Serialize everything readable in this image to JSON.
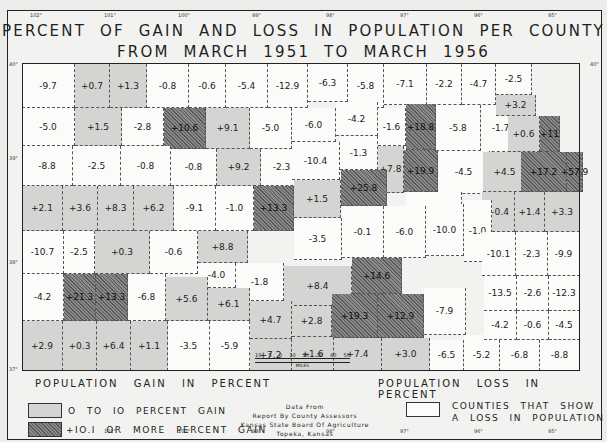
{
  "title": {
    "line1": "PERCENT OF GAIN AND LOSS IN POPULATION PER COUNTY",
    "line2": "FROM MARCH 1951 TO MARCH 1956"
  },
  "longitudes_top": [
    "102°",
    "101°",
    "100°",
    "99°",
    "98°",
    "97°",
    "96°",
    "95°"
  ],
  "longitudes_bottom": [
    "102°",
    "101°",
    "100°",
    "99°",
    "98°",
    "97°",
    "96°",
    "95°"
  ],
  "latitudes": [
    "40°",
    "39°",
    "38°",
    "37°"
  ],
  "legend": {
    "gain_heading": "POPULATION GAIN IN PERCENT",
    "loss_heading": "POPULATION LOSS IN PERCENT",
    "gain_small": "O TO IO PERCENT GAIN",
    "gain_large": "+IO.I OR MORE PERCENT GAIN",
    "loss": [
      "COUNTIES THAT SHOW",
      "A LOSS IN POPULATION"
    ],
    "scale_ticks": [
      "10",
      "5",
      "0",
      "10",
      "20",
      "30",
      "40",
      "50"
    ],
    "scale_unit": "MILES",
    "source": [
      "Data From",
      "Report By County Assessors",
      "Kansas State Board Of Agriculture",
      "Topeka, Kansas"
    ]
  },
  "counties": [
    {
      "v": "-9.7",
      "c": "loss"
    },
    {
      "v": "+0.7",
      "c": "gain"
    },
    {
      "v": "+1.3",
      "c": "gain"
    },
    {
      "v": "-0.8",
      "c": "loss"
    },
    {
      "v": "-0.6",
      "c": "loss"
    },
    {
      "v": "-5.4",
      "c": "loss"
    },
    {
      "v": "-12.9",
      "c": "loss"
    },
    {
      "v": "-6.3",
      "c": "loss"
    },
    {
      "v": "-5.8",
      "c": "loss"
    },
    {
      "v": "-7.1",
      "c": "loss"
    },
    {
      "v": "-2.2",
      "c": "loss"
    },
    {
      "v": "-4.7",
      "c": "loss"
    },
    {
      "v": "-2.5",
      "c": "loss"
    },
    {
      "v": "-5.0",
      "c": "loss"
    },
    {
      "v": "+1.5",
      "c": "gain"
    },
    {
      "v": "-2.8",
      "c": "loss"
    },
    {
      "v": "+10.6",
      "c": "big"
    },
    {
      "v": "+9.1",
      "c": "gain"
    },
    {
      "v": "-5.0",
      "c": "loss"
    },
    {
      "v": "-6.0",
      "c": "loss"
    },
    {
      "v": "-4.2",
      "c": "loss"
    },
    {
      "v": "-1.6",
      "c": "loss"
    },
    {
      "v": "+18.8",
      "c": "big"
    },
    {
      "v": "-5.8",
      "c": "loss"
    },
    {
      "v": "-1.7",
      "c": "loss"
    },
    {
      "v": "+3.2",
      "c": "gain"
    },
    {
      "v": "+0.6",
      "c": "gain"
    },
    {
      "v": "+11",
      "c": "big"
    },
    {
      "v": "-8.8",
      "c": "loss"
    },
    {
      "v": "-2.5",
      "c": "loss"
    },
    {
      "v": "-0.8",
      "c": "loss"
    },
    {
      "v": "-0.8",
      "c": "loss"
    },
    {
      "v": "+9.2",
      "c": "gain"
    },
    {
      "v": "-2.3",
      "c": "loss"
    },
    {
      "v": "-10.4",
      "c": "loss"
    },
    {
      "v": "-1.3",
      "c": "loss"
    },
    {
      "v": "+7.8",
      "c": "gain"
    },
    {
      "v": "+19.9",
      "c": "big"
    },
    {
      "v": "-4.5",
      "c": "loss"
    },
    {
      "v": "+4.5",
      "c": "gain"
    },
    {
      "v": "+17.2",
      "c": "big"
    },
    {
      "v": "+57.9",
      "c": "big"
    },
    {
      "v": "+2.1",
      "c": "gain"
    },
    {
      "v": "+3.6",
      "c": "gain"
    },
    {
      "v": "+8.3",
      "c": "gain"
    },
    {
      "v": "+6.2",
      "c": "gain"
    },
    {
      "v": "-9.1",
      "c": "loss"
    },
    {
      "v": "-1.0",
      "c": "loss"
    },
    {
      "v": "+13.3",
      "c": "big"
    },
    {
      "v": "+1.5",
      "c": "gain"
    },
    {
      "v": "+25.8",
      "c": "big"
    },
    {
      "v": "-6.6",
      "c": "loss"
    },
    {
      "v": "+0.4",
      "c": "gain"
    },
    {
      "v": "+1.4",
      "c": "gain"
    },
    {
      "v": "+3.3",
      "c": "gain"
    },
    {
      "v": "-10.7",
      "c": "loss"
    },
    {
      "v": "-2.5",
      "c": "loss"
    },
    {
      "v": "+0.3",
      "c": "gain"
    },
    {
      "v": "-0.6",
      "c": "loss"
    },
    {
      "v": "+8.8",
      "c": "gain"
    },
    {
      "v": "-3.5",
      "c": "loss"
    },
    {
      "v": "-0.1",
      "c": "loss"
    },
    {
      "v": "-6.0",
      "c": "loss"
    },
    {
      "v": "-10.0",
      "c": "loss"
    },
    {
      "v": "-1.0",
      "c": "loss"
    },
    {
      "v": "-10.1",
      "c": "loss"
    },
    {
      "v": "-2.3",
      "c": "loss"
    },
    {
      "v": "-9.9",
      "c": "loss"
    },
    {
      "v": "-4.0",
      "c": "loss"
    },
    {
      "v": "-1.8",
      "c": "loss"
    },
    {
      "v": "+8.4",
      "c": "gain"
    },
    {
      "v": "+14.6",
      "c": "big"
    },
    {
      "v": "-13.5",
      "c": "loss"
    },
    {
      "v": "-2.6",
      "c": "loss"
    },
    {
      "v": "-12.3",
      "c": "loss"
    },
    {
      "v": "-4.2",
      "c": "loss"
    },
    {
      "v": "+21.3",
      "c": "big"
    },
    {
      "v": "+13.3",
      "c": "big"
    },
    {
      "v": "-6.8",
      "c": "loss"
    },
    {
      "v": "+5.6",
      "c": "gain"
    },
    {
      "v": "+6.1",
      "c": "gain"
    },
    {
      "v": "+4.7",
      "c": "gain"
    },
    {
      "v": "+2.8",
      "c": "gain"
    },
    {
      "v": "+19.3",
      "c": "big"
    },
    {
      "v": "+12.9",
      "c": "big"
    },
    {
      "v": "-7.9",
      "c": "loss"
    },
    {
      "v": "-6.6",
      "c": "loss"
    },
    {
      "v": "-4.2",
      "c": "loss"
    },
    {
      "v": "-0.6",
      "c": "loss"
    },
    {
      "v": "-4.5",
      "c": "loss"
    },
    {
      "v": "+2.9",
      "c": "gain"
    },
    {
      "v": "+0.3",
      "c": "gain"
    },
    {
      "v": "+6.4",
      "c": "gain"
    },
    {
      "v": "+1.1",
      "c": "gain"
    },
    {
      "v": "-3.5",
      "c": "loss"
    },
    {
      "v": "-5.9",
      "c": "loss"
    },
    {
      "v": "+7.2",
      "c": "gain"
    },
    {
      "v": "+1.6",
      "c": "gain"
    },
    {
      "v": "+7.4",
      "c": "gain"
    },
    {
      "v": "+3.0",
      "c": "gain"
    },
    {
      "v": "-6.5",
      "c": "loss"
    },
    {
      "v": "-5.2",
      "c": "loss"
    },
    {
      "v": "-6.8",
      "c": "loss"
    },
    {
      "v": "-8.8",
      "c": "loss"
    }
  ]
}
